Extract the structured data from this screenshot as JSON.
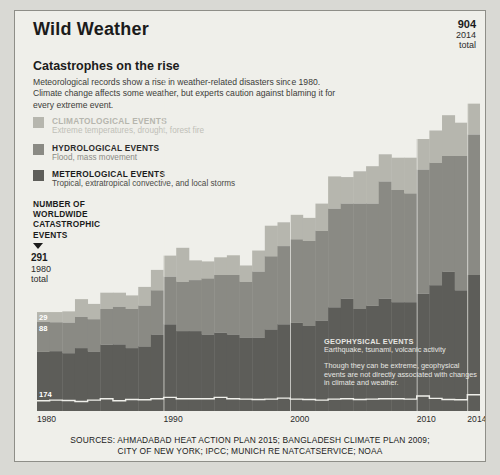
{
  "page": {
    "title": "Wild Weather",
    "headline": "Catastrophes on the rise",
    "deck": "Meteorological records show a rise in weather-related disasters since 1980. Climate change affects some weather, but experts caution against blaming it for every extreme event."
  },
  "colors": {
    "page_background": "#d9d9d4",
    "panel_background": "#efefea",
    "climatological": "#b6b6ae",
    "hydrological": "#8a8a84",
    "meteorological": "#5d5d59",
    "geophysical_outline": "#efefea",
    "text": "#1b1b1b"
  },
  "legend": {
    "items": [
      {
        "swatch": "#b6b6ae",
        "title": "CLIMATOLOGICAL EVENTS",
        "description": "Extreme temperatures, drought, forest fire",
        "title_color": "#b6b6ae",
        "desc_color": "#bfbfb8"
      },
      {
        "swatch": "#8a8a84",
        "title": "HYDROLOGICAL EVENTS",
        "description": "Flood, mass movement",
        "title_color": "#2b2b2b",
        "desc_color": "#8a8a84"
      },
      {
        "swatch": "#5d5d59",
        "title": "METEROLOGICAL EVENTS",
        "description": "Tropical, extratropical convective, and local storms",
        "title_color": "#1b1b1b",
        "desc_color": "#4a4a46"
      }
    ]
  },
  "axis_caption": {
    "line1": "NUMBER OF",
    "line2": "WORLDWIDE",
    "line3": "CATASTROPHIC",
    "line4": "EVENTS"
  },
  "callouts": {
    "start": {
      "value": "291",
      "year": "1980",
      "label": "total"
    },
    "end": {
      "value": "904",
      "year": "2014",
      "label": "total"
    },
    "start_segments": {
      "climatological": "29",
      "hydrological": "88",
      "meteorological": "174"
    },
    "end_segments": {
      "climatological": "91",
      "hydrological": "413",
      "meteorological": "400"
    }
  },
  "geophysical_note": {
    "title": "GEOPHYSICAL EVENTS",
    "description": "Earthquake, tsunami, volcanic activity",
    "paragraph": "Though they can be extreme, geophysical events are not directly associated with changes in climate and weather."
  },
  "sources": {
    "line1": "SOURCES: AHMADABAD HEAT ACTION PLAN 2015; BANGLADESH CLIMATE PLAN 2009;",
    "line2": "CITY OF NEW YORK; IPCC; MUNICH RE NATCATSERVICE; NOAA"
  },
  "chart_data": {
    "type": "bar",
    "title": "Catastrophes on the rise",
    "subtype": "stacked-column",
    "xlabel": "",
    "ylabel": "NUMBER OF WORLDWIDE CATASTROPHIC EVENTS",
    "ylim": [
      0,
      1000
    ],
    "grid": false,
    "legend_position": "upper-left",
    "categories": [
      "1980",
      "1981",
      "1982",
      "1983",
      "1984",
      "1985",
      "1986",
      "1987",
      "1988",
      "1989",
      "1990",
      "1991",
      "1992",
      "1993",
      "1994",
      "1995",
      "1996",
      "1997",
      "1998",
      "1999",
      "2000",
      "2001",
      "2002",
      "2003",
      "2004",
      "2005",
      "2006",
      "2007",
      "2008",
      "2009",
      "2010",
      "2011",
      "2012",
      "2013",
      "2014"
    ],
    "tick_labels": [
      "1980",
      "1990",
      "2000",
      "2010",
      "2014"
    ],
    "series": [
      {
        "name": "Geophysical events",
        "color": "#5d5d59",
        "outline": "#efefea",
        "values": [
          30,
          32,
          31,
          28,
          32,
          36,
          30,
          34,
          33,
          36,
          40,
          36,
          36,
          36,
          40,
          36,
          35,
          34,
          35,
          38,
          35,
          34,
          32,
          35,
          36,
          34,
          35,
          36,
          36,
          35,
          44,
          37,
          34,
          33,
          48
        ]
      },
      {
        "name": "Meterological events",
        "color": "#5d5d59",
        "values": [
          174,
          176,
          170,
          185,
          175,
          195,
          196,
          185,
          190,
          225,
          255,
          235,
          235,
          225,
          230,
          225,
          215,
          215,
          240,
          255,
          260,
          250,
          265,
          305,
          330,
          300,
          310,
          330,
          320,
          320,
          345,
          370,
          410,
          355,
          400
        ]
      },
      {
        "name": "Hydrological events",
        "color": "#8a8a84",
        "values": [
          88,
          85,
          90,
          92,
          95,
          105,
          110,
          115,
          120,
          130,
          140,
          145,
          150,
          165,
          170,
          175,
          165,
          195,
          215,
          230,
          245,
          250,
          265,
          290,
          280,
          310,
          300,
          345,
          330,
          320,
          365,
          360,
          340,
          395,
          413
        ]
      },
      {
        "name": "Climatological events",
        "color": "#b6b6ae",
        "values": [
          29,
          30,
          33,
          52,
          45,
          48,
          42,
          40,
          55,
          60,
          62,
          100,
          58,
          50,
          52,
          58,
          48,
          62,
          90,
          70,
          72,
          68,
          80,
          95,
          78,
          95,
          110,
          80,
          95,
          105,
          90,
          95,
          120,
          98,
          91
        ]
      }
    ]
  }
}
